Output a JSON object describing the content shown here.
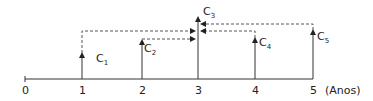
{
  "diagram": {
    "type": "cash-flow timeline",
    "axis": {
      "ticks": [
        "0",
        "1",
        "2",
        "3",
        "4",
        "5"
      ],
      "unit_label": "(Anos)"
    },
    "flows": [
      {
        "name": "C",
        "sub": "1",
        "period": 1
      },
      {
        "name": "C",
        "sub": "2",
        "period": 2
      },
      {
        "name": "C",
        "sub": "3",
        "period": 3
      },
      {
        "name": "C",
        "sub": "4",
        "period": 4
      },
      {
        "name": "C",
        "sub": "5",
        "period": 5
      }
    ],
    "colors": {
      "line": "#333333",
      "dashed": "#555555"
    }
  }
}
